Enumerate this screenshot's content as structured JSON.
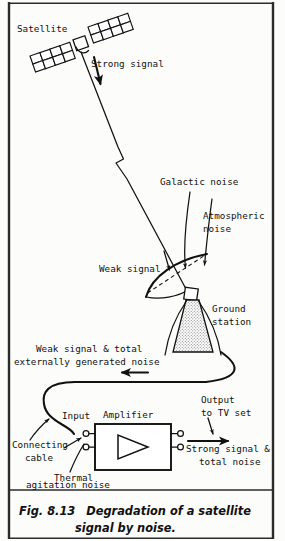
{
  "figure": {
    "number": "Fig. 8.13",
    "caption_line1": "Degradation of a satellite",
    "caption_line2": "signal by noise.",
    "caption_full": "Fig. 8.13  Degradation of a satellite signal by noise."
  },
  "labels": {
    "satellite": "Satellite",
    "strong_signal": "Strong signal",
    "galactic_noise": "Galactic noise",
    "atmospheric_noise_l1": "Atmospheric",
    "atmospheric_noise_l2": "noise",
    "weak_signal": "Weak signal",
    "ground_station_l1": "Ground",
    "ground_station_l2": "station",
    "weak_total_l1": "Weak signal & total",
    "weak_total_l2": "externally generated noise",
    "connecting_cable_l1": "Connecting",
    "connecting_cable_l2": "cable",
    "input": "Input",
    "amplifier": "Amplifier",
    "thermal_l1": "Thermal",
    "thermal_l2": "agitation noise",
    "output_l1": "Output",
    "output_l2": "to TV set",
    "strong_total_l1": "Strong signal &",
    "strong_total_l2": "total noise"
  },
  "colors": {
    "ink": "#111111",
    "paper": "#fcfcfa",
    "frame": "#2b2b2b",
    "stipple": "#9a9a9a"
  }
}
